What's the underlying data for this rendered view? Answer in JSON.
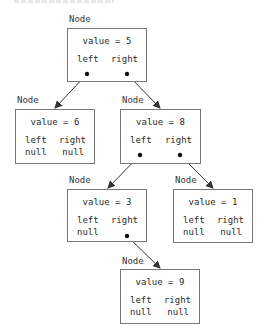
{
  "diagram": {
    "type": "binary-tree",
    "node_label": "Node",
    "field_left": "left",
    "field_right": "right",
    "null_text": "null",
    "colors": {
      "box_border": "#777777",
      "arrow": "#333333",
      "text": "#2a2a2a",
      "background": "#ffffff"
    },
    "nodes": [
      {
        "id": "n5",
        "value_text": "value = 5",
        "left": "pointer",
        "right": "pointer",
        "left_text": "",
        "right_text": ""
      },
      {
        "id": "n6",
        "value_text": "value = 6",
        "left": "null",
        "right": "null",
        "left_text": "null",
        "right_text": "null"
      },
      {
        "id": "n8",
        "value_text": "value = 8",
        "left": "pointer",
        "right": "pointer",
        "left_text": "",
        "right_text": ""
      },
      {
        "id": "n3",
        "value_text": "value = 3",
        "left": "null",
        "right": "pointer",
        "left_text": "null",
        "right_text": ""
      },
      {
        "id": "n1",
        "value_text": "value = 1",
        "left": "null",
        "right": "null",
        "left_text": "null",
        "right_text": "null"
      },
      {
        "id": "n9",
        "value_text": "value = 9",
        "left": "null",
        "right": "null",
        "left_text": "null",
        "right_text": "null"
      }
    ],
    "edges": [
      {
        "from": "n5",
        "field": "left",
        "to": "n6"
      },
      {
        "from": "n5",
        "field": "right",
        "to": "n8"
      },
      {
        "from": "n8",
        "field": "left",
        "to": "n3"
      },
      {
        "from": "n8",
        "field": "right",
        "to": "n1"
      },
      {
        "from": "n3",
        "field": "right",
        "to": "n9"
      }
    ]
  }
}
